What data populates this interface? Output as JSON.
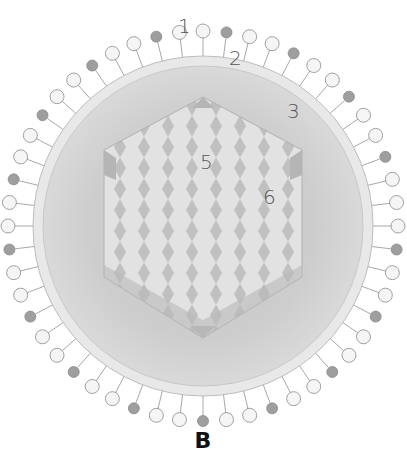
{
  "figure": {
    "panel_label": "B",
    "labels": [
      {
        "id": "1",
        "text": "1",
        "x": 178,
        "y": 14,
        "points_to": "surface glycoprotein spike"
      },
      {
        "id": "2",
        "text": "2",
        "x": 229,
        "y": 46,
        "points_to": "lipid envelope"
      },
      {
        "id": "3",
        "text": "3",
        "x": 287,
        "y": 99,
        "points_to": "tegument / matrix"
      },
      {
        "id": "5",
        "text": "5",
        "x": 200,
        "y": 150,
        "points_to": "capsid pentamer"
      },
      {
        "id": "6",
        "text": "6",
        "x": 263,
        "y": 185,
        "points_to": "capsid hexamer"
      }
    ],
    "colors": {
      "background": "#ffffff",
      "envelope": "#e6e6e6",
      "matrix": "#cfcfcf",
      "capsid_light": "#e4e4e4",
      "capsid_dark": "#b8b8b8",
      "spike_light": "#f4f4f4",
      "spike_dark": "#9a9a9a",
      "label": "#555555"
    }
  }
}
